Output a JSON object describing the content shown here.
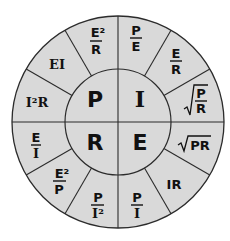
{
  "diagram": {
    "colors": {
      "fill": "#d9d9d9",
      "stroke": "#2b2b2b",
      "text": "#111111",
      "background": "#ffffff"
    },
    "center": {
      "quadrants": [
        {
          "id": "P",
          "label": "P",
          "position": "top-left",
          "meaning": "Power"
        },
        {
          "id": "I",
          "label": "I",
          "position": "top-right",
          "meaning": "Current"
        },
        {
          "id": "E",
          "label": "E",
          "position": "bottom-right",
          "meaning": "Voltage"
        },
        {
          "id": "R",
          "label": "R",
          "position": "bottom-left",
          "meaning": "Resistance"
        }
      ]
    },
    "segments": [
      {
        "quantity": "I",
        "formula": "P/E",
        "display": {
          "type": "fraction",
          "num": "P",
          "den": "E"
        }
      },
      {
        "quantity": "I",
        "formula": "E/R",
        "display": {
          "type": "fraction",
          "num": "E",
          "den": "R"
        }
      },
      {
        "quantity": "I",
        "formula": "√(P/R)",
        "display": {
          "type": "sqrt-fraction",
          "num": "P",
          "den": "R"
        }
      },
      {
        "quantity": "E",
        "formula": "√PR",
        "display": {
          "type": "sqrt",
          "text": "PR"
        }
      },
      {
        "quantity": "E",
        "formula": "IR",
        "display": {
          "type": "text",
          "text": "IR"
        }
      },
      {
        "quantity": "E",
        "formula": "P/I",
        "display": {
          "type": "fraction",
          "num": "P",
          "den": "I"
        }
      },
      {
        "quantity": "R",
        "formula": "P/I²",
        "display": {
          "type": "fraction",
          "num": "P",
          "den": "I²"
        }
      },
      {
        "quantity": "R",
        "formula": "E²/P",
        "display": {
          "type": "fraction",
          "num": "E²",
          "den": "P"
        }
      },
      {
        "quantity": "R",
        "formula": "E/I",
        "display": {
          "type": "fraction",
          "num": "E",
          "den": "I"
        }
      },
      {
        "quantity": "P",
        "formula": "I²R",
        "display": {
          "type": "text",
          "text": "I²R"
        }
      },
      {
        "quantity": "P",
        "formula": "EI",
        "display": {
          "type": "text",
          "text": "EI"
        }
      },
      {
        "quantity": "P",
        "formula": "E²/R",
        "display": {
          "type": "fraction",
          "num": "E²",
          "den": "R"
        }
      }
    ]
  }
}
